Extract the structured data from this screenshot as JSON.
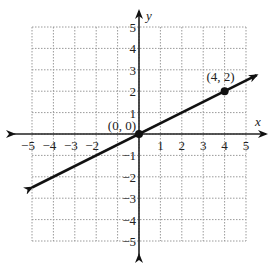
{
  "chart_data": {
    "type": "line",
    "title": "",
    "xlabel": "x",
    "ylabel": "y",
    "xlim": [
      -5,
      5
    ],
    "ylim": [
      -5,
      5
    ],
    "grid": true,
    "grid_style": "dotted",
    "x_ticks": [
      "-5",
      "-4",
      "-3",
      "-2",
      "1",
      "2",
      "3",
      "4",
      "5"
    ],
    "y_ticks": [
      "5",
      "4",
      "3",
      "2",
      "1",
      "-1",
      "-2",
      "-3",
      "-4",
      "-5"
    ],
    "series": [
      {
        "name": "line through origin",
        "equation": "y = x/2",
        "slope": 0.5,
        "intercept": 0,
        "x": [
          -5,
          5.5
        ],
        "y": [
          -2.5,
          2.75
        ],
        "arrows": "both ends"
      }
    ],
    "points": [
      {
        "x": 0,
        "y": 0,
        "label": "(0, 0)"
      },
      {
        "x": 4,
        "y": 2,
        "label": "(4, 2)"
      }
    ],
    "legend": null
  },
  "labels": {
    "x_axis": "x",
    "y_axis": "y",
    "origin_point": "(0, 0)",
    "second_point": "(4, 2)"
  },
  "colors": {
    "axis": "#222222",
    "grid": "#9a9a9a",
    "line": "#111111"
  }
}
